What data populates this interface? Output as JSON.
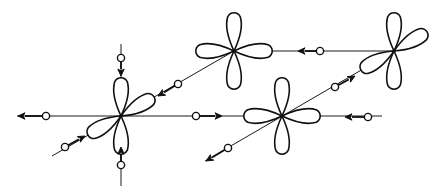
{
  "diagram": {
    "colors": {
      "stroke": "#111111",
      "background": "#ffffff"
    },
    "atoms": [
      {
        "id": "A",
        "x": 121,
        "y": 116,
        "lobe_angles": [
          90,
          270,
          30,
          210
        ],
        "lobe_len": 38
      },
      {
        "id": "B",
        "x": 234,
        "y": 51,
        "lobe_angles": [
          0,
          90,
          180,
          270
        ],
        "lobe_len": 38
      },
      {
        "id": "C",
        "x": 394,
        "y": 51,
        "lobe_angles": [
          90,
          270,
          30,
          210
        ],
        "lobe_len": 38
      },
      {
        "id": "D",
        "x": 282,
        "y": 116,
        "lobe_angles": [
          0,
          90,
          180,
          270
        ],
        "lobe_len": 38
      }
    ],
    "lines": [
      {
        "x1": 17,
        "y1": 116,
        "x2": 382,
        "y2": 116
      },
      {
        "x1": 121,
        "y1": 44,
        "x2": 121,
        "y2": 186
      },
      {
        "x1": 52,
        "y1": 156,
        "x2": 234,
        "y2": 51
      },
      {
        "x1": 234,
        "y1": 51,
        "x2": 394,
        "y2": 51
      },
      {
        "x1": 205,
        "y1": 161,
        "x2": 394,
        "y2": 51
      }
    ],
    "markers": [
      {
        "cx": 46,
        "cy": 116,
        "ax": 18,
        "ay": 116
      },
      {
        "cx": 196,
        "cy": 116,
        "ax": 222,
        "ay": 116
      },
      {
        "cx": 121,
        "cy": 58,
        "ax": 121,
        "ay": 76
      },
      {
        "cx": 121,
        "cy": 165,
        "ax": 121,
        "ay": 147
      },
      {
        "cx": 65,
        "cy": 147,
        "ax": 85,
        "ay": 136
      },
      {
        "cx": 178,
        "cy": 84,
        "ax": 158,
        "ay": 96
      },
      {
        "cx": 320,
        "cy": 51,
        "ax": 298,
        "ay": 51
      },
      {
        "cx": 368,
        "cy": 117,
        "ax": 345,
        "ay": 117
      },
      {
        "cx": 228,
        "cy": 148,
        "ax": 206,
        "ay": 161
      },
      {
        "cx": 335,
        "cy": 87,
        "ax": 355,
        "ay": 76
      }
    ]
  }
}
